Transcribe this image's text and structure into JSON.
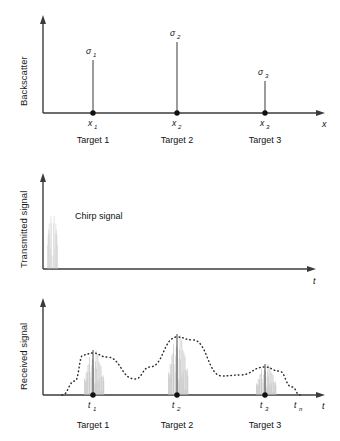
{
  "figure": {
    "type": "multi-panel-signal-diagram",
    "background": "#ffffff",
    "ink_color": "#1a1a1a",
    "chirp_color": "#b9b9b9"
  },
  "panels": [
    {
      "id": "backscatter",
      "ylabel": "Backscatter",
      "xlabel": "x",
      "series_type": "impulse",
      "points": [
        {
          "tick": "x",
          "sub": "1",
          "amplitude_label": "σ",
          "amplitude_sub": "1",
          "x": 93,
          "height": 53,
          "target": "Target 1"
        },
        {
          "tick": "x",
          "sub": "2",
          "amplitude_label": "σ",
          "amplitude_sub": "2",
          "x": 177,
          "height": 71,
          "target": "Target 2"
        },
        {
          "tick": "x",
          "sub": "3",
          "amplitude_label": "σ",
          "amplitude_sub": "3",
          "x": 265,
          "height": 32,
          "target": "Target 3"
        }
      ]
    },
    {
      "id": "transmitted",
      "ylabel": "Transmitted signal",
      "xlabel": "t",
      "series_type": "chirp-burst",
      "annotation": "Chirp signal",
      "burst": {
        "x_start": 47,
        "x_end": 58,
        "amplitude": 62
      }
    },
    {
      "id": "received",
      "ylabel": "Received signal",
      "xlabel": "t",
      "series_type": "chirp-echo-envelope",
      "end_tick": {
        "label": "t",
        "sub": "n",
        "x": 298
      },
      "points": [
        {
          "tick": "t",
          "sub": "1",
          "x": 93,
          "echo_height": 42,
          "target": "Target 1"
        },
        {
          "tick": "t",
          "sub": "2",
          "x": 177,
          "echo_height": 58,
          "target": "Target 2"
        },
        {
          "tick": "t",
          "sub": "3",
          "x": 265,
          "echo_height": 28,
          "target": "Target 3"
        }
      ]
    }
  ],
  "chart_data": {
    "type": "line",
    "title": "",
    "subplots": [
      {
        "name": "Backscatter vs range",
        "type": "bar",
        "xlabel": "x",
        "ylabel": "Backscatter",
        "categories": [
          "x1",
          "x2",
          "x3"
        ],
        "values": [
          53,
          71,
          32
        ],
        "value_labels": [
          "σ1",
          "σ2",
          "σ3"
        ],
        "category_annotations": [
          "Target 1",
          "Target 2",
          "Target 3"
        ],
        "grid": false,
        "legend": "none"
      },
      {
        "name": "Transmitted signal vs time",
        "type": "line",
        "xlabel": "t",
        "ylabel": "Transmitted signal",
        "annotations": [
          "Chirp signal"
        ],
        "x": [
          0,
          47,
          58,
          316
        ],
        "values": [
          0,
          62,
          62,
          0
        ],
        "grid": false,
        "legend": "none"
      },
      {
        "name": "Received signal vs time",
        "type": "line",
        "xlabel": "t",
        "ylabel": "Received signal",
        "x": [
          62,
          93,
          135,
          177,
          222,
          265,
          300
        ],
        "values": [
          0,
          42,
          16,
          58,
          19,
          28,
          0
        ],
        "tick_labels": [
          "t1",
          "t2",
          "t3",
          "tn"
        ],
        "category_annotations": [
          "Target 1",
          "Target 2",
          "Target 3"
        ],
        "grid": false,
        "legend": "none"
      }
    ]
  }
}
